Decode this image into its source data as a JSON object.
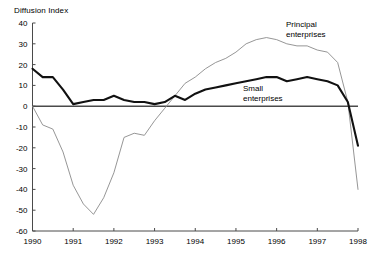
{
  "header": {
    "axis_title": "Diffusion Index",
    "ghost_top_text": ""
  },
  "annotations": {
    "principal_line1": "Principal",
    "principal_line2": "enterprises",
    "small_line1": "Small",
    "small_line2": "enterprises"
  },
  "colors": {
    "principal": "#8a8a8a",
    "small": "#111111",
    "axis": "#4a4a4a",
    "background": "#ffffff"
  },
  "chart_data": {
    "type": "line",
    "title": "Diffusion Index",
    "xlabel": "",
    "ylabel": "Diffusion Index",
    "xlim": [
      1990,
      1998
    ],
    "ylim": [
      -60,
      40
    ],
    "ytick_labels": [
      "40",
      "30",
      "20",
      "10",
      "0",
      "-10",
      "-20",
      "-30",
      "-40",
      "-50",
      "-60"
    ],
    "yticks": [
      40,
      30,
      20,
      10,
      0,
      -10,
      -20,
      -30,
      -40,
      -50,
      -60
    ],
    "xtick_labels": [
      "1990",
      "1991",
      "1992",
      "1993",
      "1994",
      "1995",
      "1996",
      "1997",
      "1998"
    ],
    "xticks": [
      1990,
      1991,
      1992,
      1993,
      1994,
      1995,
      1996,
      1997,
      1998
    ],
    "grid": false,
    "legend_position": "inline-annotation",
    "x": [
      1990.0,
      1990.25,
      1990.5,
      1990.75,
      1991.0,
      1991.25,
      1991.5,
      1991.75,
      1992.0,
      1992.25,
      1992.5,
      1992.75,
      1993.0,
      1993.25,
      1993.5,
      1993.75,
      1994.0,
      1994.25,
      1994.5,
      1994.75,
      1995.0,
      1995.25,
      1995.5,
      1995.75,
      1996.0,
      1996.25,
      1996.5,
      1996.75,
      1997.0,
      1997.25,
      1997.5,
      1997.75,
      1998.0
    ],
    "series": [
      {
        "name": "Principal enterprises",
        "style": "thin-gray",
        "values": [
          0,
          -9,
          -11,
          -22,
          -38,
          -47,
          -52,
          -44,
          -32,
          -15,
          -13,
          -14,
          -7,
          -1,
          5,
          11,
          14,
          18,
          21,
          23,
          26,
          30,
          32,
          33,
          32,
          30,
          29,
          29,
          27,
          26,
          21,
          2,
          -40
        ]
      },
      {
        "name": "Small enterprises",
        "style": "thick-black",
        "values": [
          18,
          14,
          14,
          8,
          1,
          2,
          3,
          3,
          5,
          3,
          2,
          2,
          1,
          2,
          5,
          3,
          6,
          8,
          9,
          10,
          11,
          12,
          13,
          14,
          14,
          12,
          13,
          14,
          13,
          12,
          10,
          2,
          -19
        ]
      }
    ],
    "annotations": [
      {
        "text": "Principal enterprises",
        "x": 1996.3,
        "y": 38
      },
      {
        "text": "Small enterprises",
        "x": 1995.8,
        "y": 7
      }
    ]
  }
}
